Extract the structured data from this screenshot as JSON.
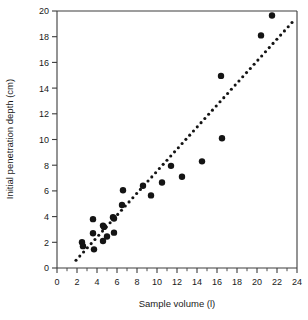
{
  "chart_data": {
    "type": "scatter",
    "title": "",
    "xlabel": "Sample volume (l)",
    "ylabel": "Initial penetration depth (cm)",
    "xlim": [
      0,
      24
    ],
    "ylim": [
      0,
      20
    ],
    "xticks": [
      0,
      2,
      4,
      6,
      8,
      10,
      12,
      14,
      16,
      18,
      20,
      22,
      24
    ],
    "yticks": [
      0,
      2,
      4,
      6,
      8,
      10,
      12,
      14,
      16,
      18,
      20
    ],
    "xtick_labels": [
      "0",
      "2",
      "4",
      "6",
      "8",
      "10",
      "12",
      "14",
      "16",
      "18",
      "20",
      "22",
      "24"
    ],
    "ytick_labels": [
      "0",
      "2",
      "4",
      "6",
      "8",
      "10",
      "12",
      "14",
      "16",
      "18",
      "20"
    ],
    "minor_ticks_per_interval": 2,
    "grid": false,
    "legend": null,
    "marker": "filled-circle",
    "marker_color": "#141414",
    "marker_size_px": 6.4,
    "points": [
      {
        "x": 2.5,
        "y": 2.0
      },
      {
        "x": 2.6,
        "y": 1.7
      },
      {
        "x": 3.6,
        "y": 3.8
      },
      {
        "x": 3.6,
        "y": 2.7
      },
      {
        "x": 3.7,
        "y": 1.45
      },
      {
        "x": 4.6,
        "y": 3.3
      },
      {
        "x": 4.7,
        "y": 3.2
      },
      {
        "x": 4.6,
        "y": 2.1
      },
      {
        "x": 5.0,
        "y": 2.45
      },
      {
        "x": 5.6,
        "y": 3.95
      },
      {
        "x": 5.7,
        "y": 3.85
      },
      {
        "x": 5.7,
        "y": 2.75
      },
      {
        "x": 6.6,
        "y": 6.05
      },
      {
        "x": 6.5,
        "y": 4.9
      },
      {
        "x": 8.6,
        "y": 6.4
      },
      {
        "x": 9.4,
        "y": 5.65
      },
      {
        "x": 10.5,
        "y": 6.65
      },
      {
        "x": 11.4,
        "y": 7.95
      },
      {
        "x": 12.5,
        "y": 7.1
      },
      {
        "x": 14.5,
        "y": 8.3
      },
      {
        "x": 16.4,
        "y": 14.95
      },
      {
        "x": 16.5,
        "y": 10.1
      },
      {
        "x": 20.4,
        "y": 18.1
      },
      {
        "x": 21.5,
        "y": 19.65
      }
    ],
    "trendline": {
      "style": "dotted",
      "color": "#141414",
      "x_start": 1.9,
      "y_start": 0.6,
      "x_end": 23.5,
      "y_end": 19.1
    }
  }
}
